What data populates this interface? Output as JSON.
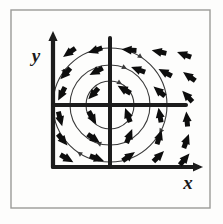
{
  "figure": {
    "kind": "hand-drawn-diagram",
    "background_color": "#fdfdfc",
    "ink_color": "#1a1a1a",
    "arc_color": "#3a3a3a",
    "frame": {
      "name": "outer-border",
      "x": 11,
      "y": 10,
      "width": 199,
      "height": 198,
      "stroke_color": "#9a9a98",
      "stroke_width": 1.4
    },
    "axes": {
      "y_label": "y",
      "x_label": "x",
      "y_label_pos": {
        "x": 36,
        "y": 62
      },
      "x_label_pos": {
        "x": 188,
        "y": 189
      },
      "origin": {
        "x": 110,
        "y": 105
      },
      "main_vertical": {
        "x": 53,
        "y_top": 38,
        "y_bottom": 167
      },
      "main_horizontal": {
        "y": 167,
        "x_left": 53,
        "x_right": 196
      },
      "inner_vertical": {
        "x": 110,
        "y_top": 38,
        "y_bottom": 167
      },
      "inner_horizontal": {
        "y": 105,
        "x_left": 53,
        "x_right": 186
      },
      "stroke_width": 4.2
    },
    "circles": [
      {
        "name": "inner-flow-circle",
        "cx": 110,
        "cy": 105,
        "r": 24
      },
      {
        "name": "middle-flow-circle",
        "cx": 110,
        "cy": 105,
        "r": 40
      },
      {
        "name": "outer-flow-circle",
        "cx": 110,
        "cy": 105,
        "r": 57
      }
    ],
    "circle_stroke_width": 1.1,
    "flow_direction": "counterclockwise",
    "arrow_style": {
      "shaft_width": 5.0,
      "head_length": 8,
      "head_width": 9,
      "length": 13
    }
  },
  "chart_data": {
    "type": "scatter",
    "xlabel": "x",
    "ylabel": "y",
    "grid": false,
    "legend": null,
    "field_type": "rotational-vortex",
    "rotation": "counterclockwise",
    "origin_px": {
      "x": 110,
      "y": 105
    },
    "note": "Each vector is tangent to a circle centred on the origin; angle_deg is measured in screen space, 0 = pointing right, increasing counterclockwise.",
    "vectors": [
      {
        "x": 70,
        "y": 52,
        "angle_deg": 215
      },
      {
        "x": 96,
        "y": 50,
        "angle_deg": 198
      },
      {
        "x": 130,
        "y": 50,
        "angle_deg": 175
      },
      {
        "x": 160,
        "y": 52,
        "angle_deg": 168
      },
      {
        "x": 185,
        "y": 55,
        "angle_deg": 160
      },
      {
        "x": 66,
        "y": 73,
        "angle_deg": 228
      },
      {
        "x": 97,
        "y": 71,
        "angle_deg": 208
      },
      {
        "x": 139,
        "y": 70,
        "angle_deg": 160
      },
      {
        "x": 166,
        "y": 73,
        "angle_deg": 152
      },
      {
        "x": 190,
        "y": 77,
        "angle_deg": 145
      },
      {
        "x": 62,
        "y": 93,
        "angle_deg": 243
      },
      {
        "x": 94,
        "y": 93,
        "angle_deg": 228
      },
      {
        "x": 125,
        "y": 90,
        "angle_deg": 150
      },
      {
        "x": 160,
        "y": 92,
        "angle_deg": 140
      },
      {
        "x": 188,
        "y": 97,
        "angle_deg": 133
      },
      {
        "x": 60,
        "y": 118,
        "angle_deg": 285
      },
      {
        "x": 92,
        "y": 117,
        "angle_deg": 300
      },
      {
        "x": 128,
        "y": 116,
        "angle_deg": 110
      },
      {
        "x": 160,
        "y": 116,
        "angle_deg": 100
      },
      {
        "x": 187,
        "y": 120,
        "angle_deg": 95
      },
      {
        "x": 62,
        "y": 139,
        "angle_deg": 310
      },
      {
        "x": 93,
        "y": 138,
        "angle_deg": 325
      },
      {
        "x": 129,
        "y": 137,
        "angle_deg": 68
      },
      {
        "x": 159,
        "y": 138,
        "angle_deg": 72
      },
      {
        "x": 186,
        "y": 142,
        "angle_deg": 70
      },
      {
        "x": 66,
        "y": 158,
        "angle_deg": 330
      },
      {
        "x": 96,
        "y": 158,
        "angle_deg": 340
      },
      {
        "x": 128,
        "y": 157,
        "angle_deg": 35
      },
      {
        "x": 158,
        "y": 157,
        "angle_deg": 45
      },
      {
        "x": 184,
        "y": 160,
        "angle_deg": 50
      }
    ],
    "flow_circles": [
      {
        "radius_px": 24,
        "direction": "counterclockwise"
      },
      {
        "radius_px": 40,
        "direction": "counterclockwise"
      },
      {
        "radius_px": 57,
        "direction": "counterclockwise"
      }
    ]
  }
}
